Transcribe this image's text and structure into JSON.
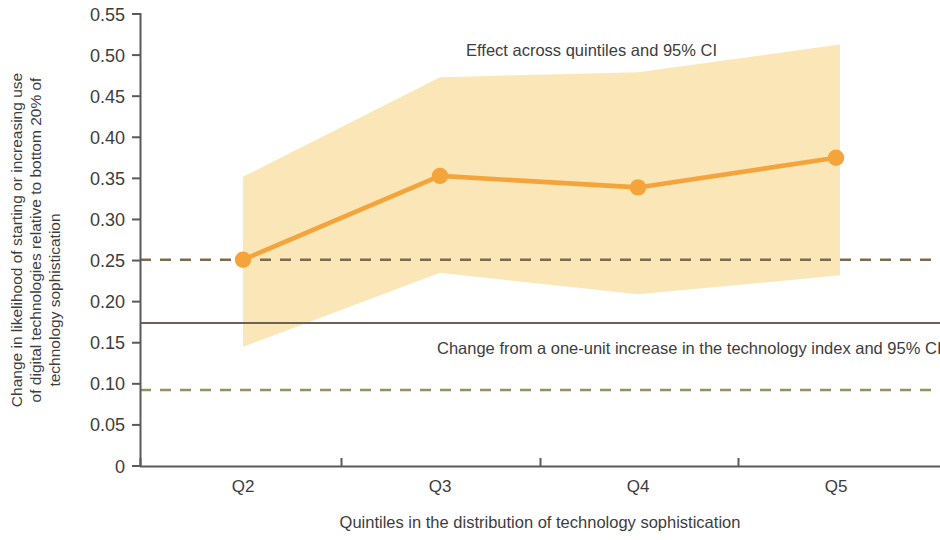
{
  "chart_data": {
    "type": "line",
    "title": "",
    "subtitle": "",
    "xlabel": "Quintiles in the distribution of technology sophistication",
    "ylabel": "Change in likelihood of starting or increasing use of digital technologies relative to bottom 20% of technology sophistication",
    "ylabel_lines": [
      "Change in likelihood of starting or increasing use",
      "of digital technologies relative to bottom 20% of",
      "technology sophistication"
    ],
    "categories": [
      "Q2",
      "Q3",
      "Q4",
      "Q5"
    ],
    "xlim": [
      0.5,
      4.5
    ],
    "ylim": [
      0,
      0.55
    ],
    "grid": false,
    "legend": "none",
    "ytick_labels": [
      "0",
      "0.05",
      "0.10",
      "0.15",
      "0.20",
      "0.25",
      "0.30",
      "0.35",
      "0.40",
      "0.45",
      "0.50",
      "0.55"
    ],
    "ytick_values": [
      0,
      0.05,
      0.1,
      0.15,
      0.2,
      0.25,
      0.3,
      0.35,
      0.4,
      0.45,
      0.5,
      0.55
    ],
    "series": [
      {
        "name": "Effect across quintiles",
        "type": "line",
        "color": "#f5a43c",
        "marker": "circle",
        "values": [
          0.251,
          0.353,
          0.339,
          0.375
        ]
      },
      {
        "name": "95% CI band",
        "type": "area",
        "color": "#fbe6b8",
        "upper": [
          0.352,
          0.473,
          0.479,
          0.513
        ],
        "lower": [
          0.145,
          0.235,
          0.209,
          0.232
        ]
      }
    ],
    "reference_lines": [
      {
        "name": "technology-index-ci-upper",
        "value": 0.251,
        "style": "dashed",
        "color": "#7d6a4e"
      },
      {
        "name": "technology-index-estimate",
        "value": 0.174,
        "style": "solid",
        "color": "#6b6158"
      },
      {
        "name": "technology-index-ci-lower",
        "value": 0.0925,
        "style": "dashed",
        "color": "#9a8d5e"
      }
    ],
    "annotations": [
      {
        "name": "effect-across-quintiles-annotation",
        "text": "Effect across quintiles and 95% CI",
        "x": 1.96,
        "y": 0.503
      },
      {
        "name": "technology-index-annotation",
        "text": "Change from a one-unit increase in the technology index and 95% CI",
        "x": 1.86,
        "y": 0.16
      }
    ]
  },
  "colors": {
    "line": "#f5a43c",
    "band": "#fbe6b8",
    "axis": "#5a5a5a",
    "text": "#3d3d3d",
    "ref_solid": "#6b6158",
    "ref_dashed_upper": "#7d6a4e",
    "ref_dashed_lower": "#9a8d5e",
    "background": "#ffffff"
  }
}
